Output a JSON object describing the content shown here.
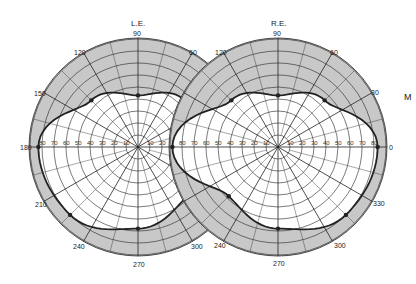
{
  "chart_data": {
    "type": "polar-visual-field",
    "charts": [
      {
        "eye": "L.E.",
        "center_px": [
          138,
          147
        ],
        "angle_labels": [
          90,
          120,
          150,
          180,
          210,
          240,
          270,
          300,
          60
        ],
        "radial_ticks": [
          10,
          20,
          30,
          40,
          50,
          60,
          70,
          80,
          90
        ],
        "field_boundary_deg": [
          {
            "angle": 0,
            "ecc": 88
          },
          {
            "angle": 45,
            "ecc": 55
          },
          {
            "angle": 90,
            "ecc": 43
          },
          {
            "angle": 135,
            "ecc": 55
          },
          {
            "angle": 180,
            "ecc": 83
          },
          {
            "angle": 225,
            "ecc": 80
          },
          {
            "angle": 270,
            "ecc": 68
          },
          {
            "angle": 315,
            "ecc": 58
          }
        ]
      },
      {
        "eye": "R.E.",
        "center_px": [
          278,
          147
        ],
        "angle_labels": [
          90,
          120,
          60,
          30,
          0,
          330,
          300,
          270,
          240
        ],
        "radial_ticks": [
          10,
          20,
          30,
          40,
          50,
          60,
          70,
          80,
          90
        ],
        "field_boundary_deg": [
          {
            "angle": 0,
            "ecc": 83
          },
          {
            "angle": 45,
            "ecc": 55
          },
          {
            "angle": 90,
            "ecc": 43
          },
          {
            "angle": 135,
            "ecc": 55
          },
          {
            "angle": 180,
            "ecc": 88
          },
          {
            "angle": 225,
            "ecc": 58
          },
          {
            "angle": 270,
            "ecc": 68
          },
          {
            "angle": 315,
            "ecc": 80
          }
        ]
      }
    ],
    "grid": true,
    "legend": null
  },
  "labels": {
    "left_eye": "L.E.",
    "right_eye": "R.E.",
    "side_letter": "M",
    "a90": "90",
    "a120": "120",
    "a150": "150",
    "a180": "180",
    "a210": "210",
    "a240": "240",
    "a270": "270",
    "a300": "300",
    "a60": "60",
    "a30": "30",
    "a0": "0",
    "a330": "330",
    "t10": "10",
    "t20": "20",
    "t30": "30",
    "t40": "40",
    "t50": "50",
    "t60": "60",
    "t70": "70",
    "t80": "80"
  },
  "colors": {
    "ring_gray": "#c8c8c8",
    "line": "#222222",
    "field": "#ffffff"
  }
}
